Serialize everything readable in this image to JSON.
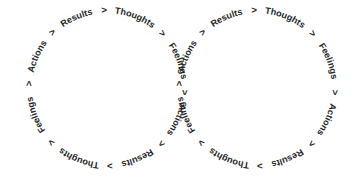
{
  "diagram": {
    "type": "figure-eight-cycle",
    "background_color": "#ffffff",
    "text_color": "#262626",
    "cycle_steps": [
      "Thoughts",
      "Feelings",
      "Actions",
      "Results"
    ],
    "separator": ">",
    "loops": [
      {
        "id": "left-loop",
        "name": "left-cycle-loop",
        "center_x": 107,
        "center_y": 88,
        "radius": 78,
        "orientation": "upright-at-top",
        "sequence": [
          "Thoughts",
          ">",
          "Feelings",
          ">",
          "Actions",
          ">",
          "Results",
          ">",
          "Thoughts",
          ">",
          "Feelings",
          ">",
          "Actions",
          ">",
          "Results",
          ">"
        ]
      },
      {
        "id": "right-loop",
        "name": "right-cycle-loop",
        "center_x": 257,
        "center_y": 88,
        "radius": 78,
        "orientation": "upright-at-bottom",
        "sequence": [
          "Thoughts",
          ">",
          "Feelings",
          ">",
          "Actions",
          ">",
          "Results",
          ">",
          "Thoughts",
          ">",
          "Feelings",
          ">",
          "Actions",
          ">",
          "Results",
          ">"
        ]
      }
    ],
    "left_loop_text": "Thoughts > Feelings > Actions > Results > Thoughts > Feelings > Actions > Results >",
    "right_loop_text": "Thoughts > Feelings > Actions > Results > Thoughts > Feelings > Actions > Results >"
  }
}
